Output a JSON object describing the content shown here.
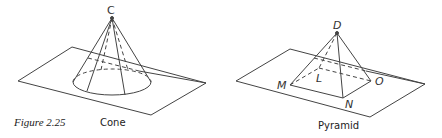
{
  "figure": {
    "number_label": "Figure 2.25",
    "colors": {
      "stroke": "#444444",
      "text": "#222222",
      "background": "#ffffff"
    }
  },
  "cone": {
    "caption": "Cone",
    "apex_label": "C"
  },
  "pyramid": {
    "caption": "Pyramid",
    "apex_label": "D",
    "base_labels": {
      "M": "M",
      "N": "N",
      "O": "O",
      "L": "L"
    }
  }
}
